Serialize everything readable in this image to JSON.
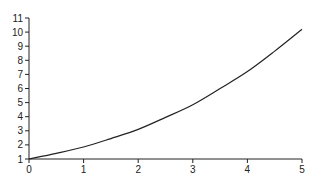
{
  "chart_data": {
    "type": "line",
    "title": "",
    "xlabel": "",
    "ylabel": "",
    "xlim": [
      0,
      5
    ],
    "ylim": [
      1,
      11
    ],
    "x_ticks": [
      "0",
      "1",
      "2",
      "3",
      "4",
      "5"
    ],
    "y_ticks": [
      "1",
      "2",
      "3",
      "4",
      "5",
      "6",
      "7",
      "8",
      "9",
      "10",
      "11"
    ],
    "grid": false,
    "legend": null,
    "series": [
      {
        "name": "curve",
        "color": "#222222",
        "x": [
          0,
          0.5,
          1,
          1.5,
          2,
          2.5,
          3,
          3.5,
          4,
          4.5,
          5
        ],
        "y": [
          1.0,
          1.4,
          1.85,
          2.45,
          3.1,
          3.95,
          4.85,
          6.0,
          7.2,
          8.65,
          10.2
        ]
      }
    ]
  }
}
